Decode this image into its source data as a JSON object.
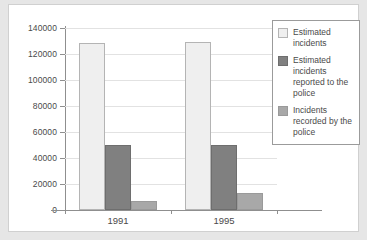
{
  "chart_data": {
    "type": "bar",
    "title": "",
    "subtitle": "",
    "xlabel": "",
    "ylabel": "",
    "categories": [
      "1991",
      "1995"
    ],
    "series": [
      {
        "name": "Estimated incidents",
        "values": [
          128500,
          129000
        ],
        "color": "#efefef"
      },
      {
        "name": "Estimated incidents reported to the police",
        "values": [
          50000,
          50000
        ],
        "color": "#808080"
      },
      {
        "name": "Incidents recorded by the police",
        "values": [
          7000,
          13000
        ],
        "color": "#a8a8a8"
      }
    ],
    "ylim": [
      0,
      140000
    ],
    "yticks": [
      0,
      20000,
      40000,
      60000,
      80000,
      100000,
      120000,
      140000
    ],
    "ytick_labels": [
      "0",
      "20000",
      "40000",
      "60000",
      "80000",
      "100000",
      "120000",
      "140000"
    ],
    "grid": true,
    "grid_axis": "y",
    "legend_position": "upper-right",
    "legend_entries": [
      "Estimated incidents",
      "Estimated incidents reported to the police",
      "Incidents recorded by the police"
    ],
    "background_color": "#ffffff",
    "figure_background_color": "#e6e6e6",
    "axis_color": "#8f8f8f",
    "gridline_color": "#e2e2e2",
    "text_color": "#4a4a4a"
  }
}
